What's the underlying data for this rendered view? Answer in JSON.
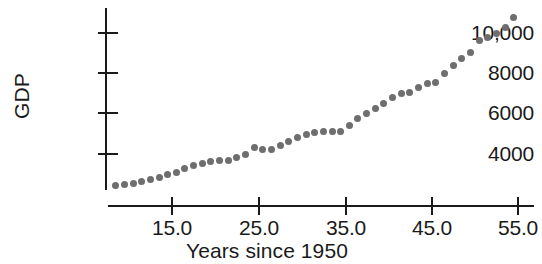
{
  "chart_data": {
    "type": "scatter",
    "title": "",
    "xlabel": "Years since 1950",
    "ylabel": "GDP",
    "xlim": [
      7.5,
      56.0
    ],
    "ylim": [
      2000,
      11200
    ],
    "grid": false,
    "legend": null,
    "marker": {
      "shape": "circle",
      "color": "#6e6e6e",
      "size_px": 7
    },
    "axis_color": "#1a1a1a",
    "xticks": [
      "15.0",
      "25.0",
      "35.0",
      "45.0",
      "55.0"
    ],
    "xtick_values": [
      15.0,
      25.0,
      35.0,
      45.0,
      55.0
    ],
    "yticks": [
      "4000",
      "6000",
      "8000",
      "10,000"
    ],
    "ytick_values": [
      4000,
      6000,
      8000,
      10000
    ],
    "series": [
      {
        "name": "GDP",
        "x": [
          8.5,
          9.5,
          10.5,
          11.5,
          12.5,
          13.5,
          14.5,
          15.5,
          16.5,
          17.5,
          18.5,
          19.5,
          20.5,
          21.5,
          22.5,
          23.5,
          24.5,
          25.5,
          26.5,
          27.5,
          28.5,
          29.5,
          30.5,
          31.5,
          32.5,
          33.5,
          34.5,
          35.5,
          36.5,
          37.5,
          38.5,
          39.5,
          40.5,
          41.5,
          42.5,
          43.5,
          44.5,
          45.5,
          46.5,
          47.5,
          48.5,
          49.5,
          50.5,
          51.5,
          52.5,
          53.5,
          54.5
        ],
        "y": [
          2450,
          2500,
          2560,
          2640,
          2720,
          2840,
          2960,
          3100,
          3260,
          3420,
          3520,
          3640,
          3700,
          3700,
          3820,
          3960,
          4300,
          4230,
          4230,
          4420,
          4620,
          4800,
          4980,
          5060,
          5100,
          5100,
          5120,
          5400,
          5760,
          6020,
          6260,
          6500,
          6780,
          7000,
          7050,
          7300,
          7520,
          7560,
          8000,
          8380,
          8720,
          9060,
          9620,
          9800,
          10000,
          10260,
          10750
        ]
      }
    ]
  },
  "axis_geometry": {
    "plot_left_px": 106,
    "plot_right_px": 534,
    "plot_top_px": 8,
    "plot_bottom_px": 206,
    "x_px_per_unit": 8.65,
    "x_origin_px": 172,
    "x_origin_value": 15,
    "y_px_4000": 154,
    "y_px_per_2000": 40.3
  }
}
